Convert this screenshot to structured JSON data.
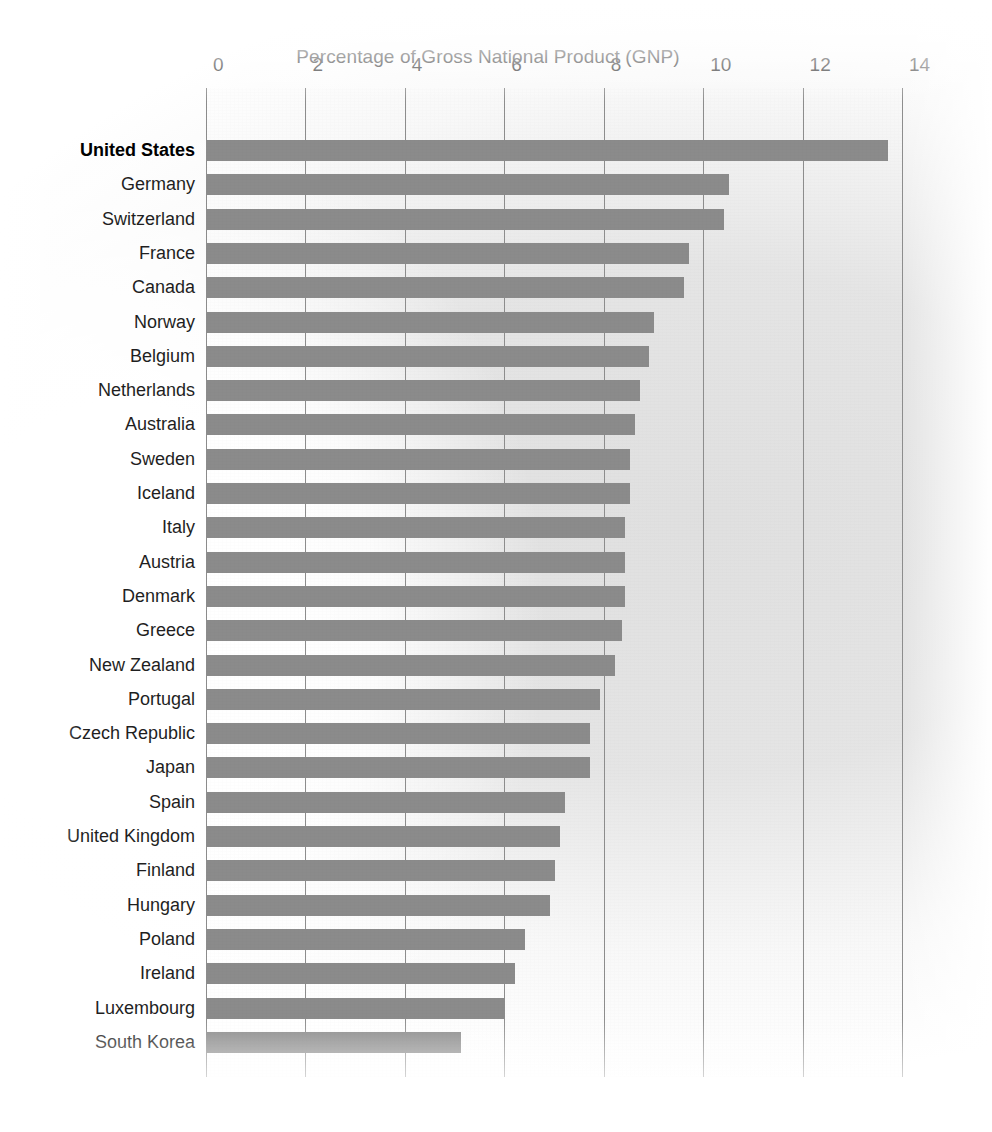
{
  "chart_data": {
    "type": "bar",
    "orientation": "horizontal",
    "title": "Percentage of Gross National Product (GNP)",
    "xlabel": "",
    "ylabel": "",
    "xlim": [
      0,
      14
    ],
    "xticks": [
      0,
      2,
      4,
      6,
      8,
      10,
      12,
      14
    ],
    "xtick_labels": [
      "0",
      "2",
      "4",
      "6",
      "8",
      "10",
      "12",
      "14"
    ],
    "grid": true,
    "legend": null,
    "bar_color": "#8b8b8b",
    "emphasis_category": "United States",
    "categories": [
      "United States",
      "Germany",
      "Switzerland",
      "France",
      "Canada",
      "Norway",
      "Belgium",
      "Netherlands",
      "Australia",
      "Sweden",
      "Iceland",
      "Italy",
      "Austria",
      "Denmark",
      "Greece",
      "New Zealand",
      "Portugal",
      "Czech Republic",
      "Japan",
      "Spain",
      "United Kingdom",
      "Finland",
      "Hungary",
      "Poland",
      "Ireland",
      "Luxembourg",
      "South Korea"
    ],
    "values": [
      13.7,
      10.5,
      10.4,
      9.7,
      9.6,
      9.0,
      8.9,
      8.7,
      8.6,
      8.5,
      8.5,
      8.4,
      8.4,
      8.4,
      8.35,
      8.2,
      7.9,
      7.7,
      7.7,
      7.2,
      7.1,
      7.0,
      6.9,
      6.4,
      6.2,
      6.0,
      5.1
    ]
  }
}
